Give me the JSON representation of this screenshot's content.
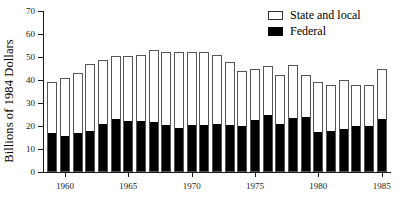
{
  "chart_data": {
    "type": "bar",
    "subtype": "stacked-vertical",
    "title": "",
    "xlabel": "",
    "ylabel": "Billions of 1984 Dollars",
    "ylim": [
      0,
      70
    ],
    "yticks": [
      0,
      10,
      20,
      30,
      40,
      50,
      60,
      70
    ],
    "ytick_labels": [
      "0",
      "10",
      "20",
      "30",
      "40",
      "50",
      "60",
      "70"
    ],
    "xtick_labels": [
      "1960",
      "1965",
      "1970",
      "1975",
      "1980",
      "1985"
    ],
    "xtick_years": [
      1960,
      1965,
      1970,
      1975,
      1980,
      1985
    ],
    "grid": false,
    "legend_position": "top-right",
    "legend": [
      "State and local",
      "Federal"
    ],
    "categories": [
      1959,
      1960,
      1961,
      1962,
      1963,
      1964,
      1965,
      1966,
      1967,
      1968,
      1969,
      1970,
      1971,
      1972,
      1973,
      1974,
      1975,
      1976,
      1977,
      1978,
      1979,
      1980,
      1981,
      1982,
      1983,
      1984,
      1985
    ],
    "series": [
      {
        "name": "Federal",
        "color": "#000000",
        "values": [
          17.0,
          15.8,
          17.0,
          17.8,
          21.0,
          23.0,
          22.0,
          22.0,
          21.8,
          20.3,
          19.0,
          20.3,
          20.5,
          21.0,
          20.5,
          20.0,
          22.5,
          25.0,
          21.0,
          23.5,
          24.0,
          17.5,
          18.0,
          18.5,
          19.8,
          20.0,
          23.0
        ]
      },
      {
        "name": "State and local",
        "color": "#ffffff",
        "values": [
          22.0,
          25.2,
          26.0,
          29.2,
          27.5,
          27.5,
          28.5,
          29.0,
          31.2,
          31.7,
          33.0,
          31.7,
          31.5,
          30.0,
          27.5,
          24.0,
          22.5,
          21.0,
          21.0,
          23.0,
          18.0,
          21.5,
          20.0,
          21.5,
          18.2,
          18.0,
          22.0
        ]
      }
    ],
    "totals": [
      39.0,
      41.0,
      43.0,
      47.0,
      48.5,
      50.5,
      50.5,
      51.0,
      53.0,
      52.0,
      52.0,
      52.0,
      52.0,
      51.0,
      48.0,
      44.0,
      45.0,
      46.0,
      42.0,
      46.5,
      42.0,
      39.0,
      38.0,
      40.0,
      38.0,
      38.0,
      45.0
    ]
  },
  "legend": {
    "items": [
      {
        "label": "State and local",
        "swatch": "outline"
      },
      {
        "label": "Federal",
        "swatch": "solid"
      }
    ]
  }
}
